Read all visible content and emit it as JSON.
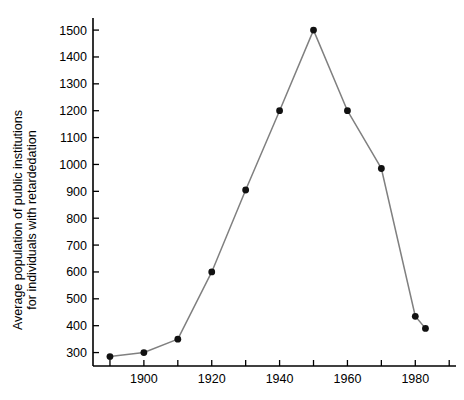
{
  "chart_data": {
    "type": "line",
    "title": "",
    "subtitle": "",
    "xlabel": "",
    "ylabel": "Average population of public institutions for individuals with retardedation",
    "ylabel_lines": [
      "Average population of public institutions",
      "for individuals with retardedation"
    ],
    "x": [
      1890,
      1900,
      1910,
      1920,
      1930,
      1940,
      1950,
      1960,
      1970,
      1980,
      1983
    ],
    "values": [
      285,
      300,
      350,
      600,
      905,
      1200,
      1500,
      1200,
      985,
      435,
      390
    ],
    "series": [
      {
        "name": "Average population",
        "values": [
          285,
          300,
          350,
          600,
          905,
          1200,
          1500,
          1200,
          985,
          435,
          390
        ]
      }
    ],
    "xlim": [
      1885,
      1992
    ],
    "ylim": [
      250,
      1545
    ],
    "x_tick_values": [
      1890,
      1900,
      1910,
      1920,
      1930,
      1940,
      1950,
      1960,
      1970,
      1980,
      1990
    ],
    "x_tick_labels": [
      "",
      "1900",
      "",
      "1920",
      "",
      "1940",
      "",
      "1960",
      "",
      "1980",
      ""
    ],
    "x_major_labels": [
      "1900",
      "1920",
      "1940",
      "1960",
      "1980"
    ],
    "y_tick_values": [
      300,
      400,
      500,
      600,
      700,
      800,
      900,
      1000,
      1100,
      1200,
      1300,
      1400,
      1500
    ],
    "y_tick_labels": [
      "300",
      "400",
      "500",
      "600",
      "700",
      "800",
      "900",
      "1000",
      "1100",
      "1200",
      "1300",
      "1400",
      "1500"
    ],
    "grid": false,
    "legend": false,
    "legend_position": "none",
    "marker": "circle",
    "colors": {
      "line": "#808080",
      "marker": "#111111",
      "axis": "#000000",
      "background": "#ffffff"
    }
  }
}
